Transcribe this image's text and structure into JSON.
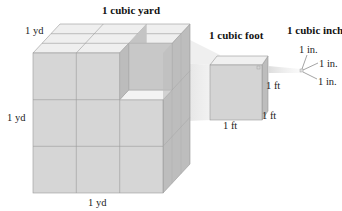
{
  "titles": {
    "yard": "1 cubic yard",
    "foot": "1 cubic foot",
    "inch": "1 cubic inch"
  },
  "yard_labels": {
    "top": "1 yd",
    "left": "1 yd",
    "bottom": "1 yd"
  },
  "foot_labels": {
    "right": "1 ft",
    "depth": "1 ft",
    "bottom": "1 ft"
  },
  "inch_labels": {
    "top": "1 in.",
    "middle": "1 in.",
    "bottom": "1 in."
  },
  "colors": {
    "front_face": "#d6d6d6",
    "top_face": "#efefef",
    "side_face": "#bdbdbd",
    "grid_line": "#9a9a9a"
  }
}
